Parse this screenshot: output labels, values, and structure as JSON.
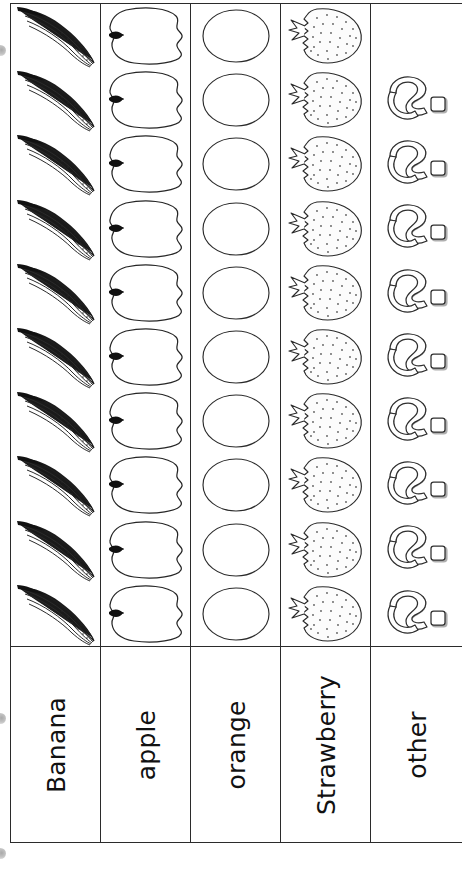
{
  "worksheet": {
    "title": "Favorite Fruit Pictograph",
    "type": "pictograph-tally-chart",
    "columns": [
      {
        "label": "Banana",
        "icon": "banana-icon",
        "count": 10,
        "offset_rows": 0
      },
      {
        "label": "apple",
        "icon": "apple-icon",
        "count": 10,
        "offset_rows": 0
      },
      {
        "label": "orange",
        "icon": "orange-icon",
        "count": 10,
        "offset_rows": 0
      },
      {
        "label": "Strawberry",
        "icon": "strawberry-icon",
        "count": 10,
        "offset_rows": 0
      },
      {
        "label": "other",
        "icon": "question-mark-icon",
        "count": 10,
        "offset_rows": 1
      }
    ]
  },
  "chart_data": {
    "type": "bar",
    "orientation": "vertical-pictograph",
    "xlabel": "",
    "ylabel": "",
    "categories": [
      "Banana",
      "apple",
      "orange",
      "Strawberry",
      "other"
    ],
    "values": [
      10,
      10,
      10,
      10,
      10
    ],
    "ylim": [
      0,
      10
    ],
    "grid": false,
    "legend": null,
    "icons": [
      "banana-icon",
      "apple-icon",
      "orange-icon",
      "strawberry-icon",
      "question-mark-icon"
    ]
  },
  "colors": {
    "ink": "#2b2b2b",
    "line": "#333333",
    "paper": "#ffffff",
    "shadow": "#8d8d8d"
  }
}
